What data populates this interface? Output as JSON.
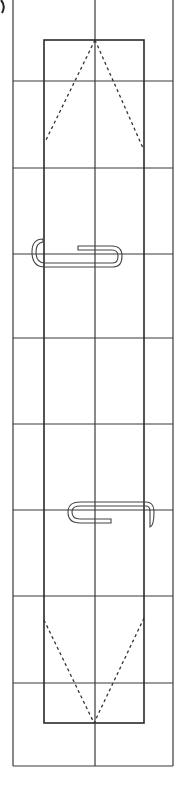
{
  "diagram": {
    "title": "",
    "width": 182,
    "height": 785,
    "colors": {
      "background": "#ffffff",
      "grid_line": "#3a3a3a",
      "outline": "#2a2a2a",
      "dashed": "#333333",
      "clip": "#444444"
    },
    "outer_frame": {
      "x1": 13,
      "y1": 0,
      "x2": 173,
      "y2": 766
    },
    "grid": {
      "vertical_lines_x": [
        13,
        44,
        95,
        144,
        173
      ],
      "horizontal_lines_y": [
        81,
        168,
        254,
        338,
        424,
        510,
        596,
        683,
        766
      ]
    },
    "inner_rect": {
      "x1": 44,
      "y1": 40,
      "x2": 144,
      "y2": 723
    },
    "fold_lines": [
      {
        "name": "top-left-fold",
        "x1": 95,
        "y1": 40,
        "x2": 45,
        "y2": 142
      },
      {
        "name": "top-right-fold",
        "x1": 95,
        "y1": 40,
        "x2": 143,
        "y2": 148
      },
      {
        "name": "bottom-left-fold",
        "x1": 44,
        "y1": 620,
        "x2": 94,
        "y2": 723
      },
      {
        "name": "bottom-right-fold",
        "x1": 144,
        "y1": 618,
        "x2": 94,
        "y2": 723
      }
    ],
    "paper_clips": [
      {
        "name": "paper-clip-upper",
        "position": "left-edge",
        "y": 254
      },
      {
        "name": "paper-clip-lower",
        "position": "right-edge",
        "y": 510
      }
    ]
  }
}
